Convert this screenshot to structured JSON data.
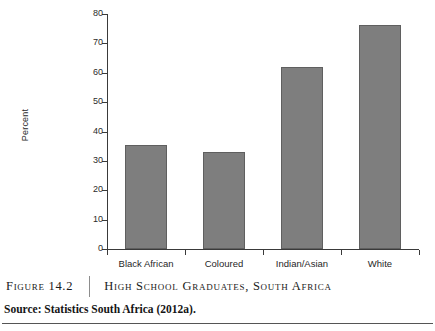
{
  "chart_data": {
    "type": "bar",
    "title": "High School Graduates, South Africa",
    "xlabel": "",
    "ylabel": "Percent",
    "ylim": [
      0,
      80
    ],
    "yticks": [
      0,
      10,
      20,
      30,
      40,
      50,
      60,
      70,
      80
    ],
    "grid": false,
    "legend": null,
    "categories": [
      "Black African",
      "Coloured",
      "Indian/Asian",
      "White"
    ],
    "values": [
      35.4,
      33.0,
      61.9,
      76.3
    ],
    "bar_color": "#7e7e7e",
    "bar_edge_color": "#5f5f5f",
    "axis_color": "#3a3a3a"
  },
  "caption": {
    "figure_number": "Figure 14.2",
    "figure_title": "High School Graduates, South Africa",
    "source": "Source: Statistics South Africa (2012a)."
  }
}
